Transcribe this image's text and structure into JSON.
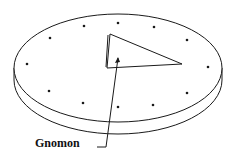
{
  "diagram": {
    "label": "Gnomon",
    "colors": {
      "stroke": "#1a1a1a",
      "background": "#ffffff"
    },
    "dial": {
      "cx": 118,
      "cy": 68,
      "rx": 104,
      "ry": 54,
      "thickness": 12
    },
    "hour_marks": [
      [
        118,
        23
      ],
      [
        154,
        27
      ],
      [
        187,
        40
      ],
      [
        208,
        67
      ],
      [
        187,
        93
      ],
      [
        153,
        105
      ],
      [
        118,
        107
      ],
      [
        83,
        103
      ],
      [
        49,
        91
      ],
      [
        27,
        64
      ],
      [
        50,
        38
      ],
      [
        84,
        26
      ]
    ],
    "gnomon": {
      "points": "110,34 182,64 107,68"
    },
    "pointer": {
      "path": "97,147 106,147 118,58"
    }
  }
}
